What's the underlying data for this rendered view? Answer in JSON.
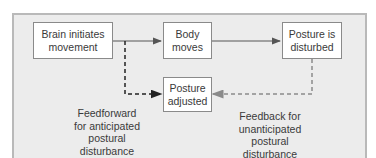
{
  "diagram": {
    "type": "flowchart",
    "nodes": {
      "brain": {
        "id": "brain",
        "label": "Brain initiates\nmovement"
      },
      "body": {
        "id": "body",
        "label": "Body\nmoves"
      },
      "disturbed": {
        "id": "disturbed",
        "label": "Posture is\ndisturbed"
      },
      "adjusted": {
        "id": "adjusted",
        "label": "Posture\nadjusted"
      }
    },
    "edges": [
      {
        "from": "brain",
        "to": "body",
        "style": "solid",
        "color": "#555555"
      },
      {
        "from": "body",
        "to": "disturbed",
        "style": "solid",
        "color": "#555555"
      },
      {
        "from": "brain",
        "to": "adjusted",
        "style": "dashed",
        "color": "#222222",
        "label": "Feedforward for anticipated postural disturbance"
      },
      {
        "from": "disturbed",
        "to": "adjusted",
        "style": "dashed",
        "color": "#8a8a8a",
        "label": "Feedback for unanticipated postural disturbance"
      }
    ],
    "annotations": {
      "feedforward": "Feedforward\nfor anticipated\npostural\ndisturbance",
      "feedback": "Feedback  for\nunanticipated\npostural\ndisturbance"
    },
    "colors": {
      "panel_bg": "#ececec",
      "panel_border": "#b9b9b9",
      "box_bg": "#ffffff",
      "box_border": "#8a8a8a",
      "feedforward_line": "#222222",
      "feedback_line": "#8a8a8a"
    }
  }
}
